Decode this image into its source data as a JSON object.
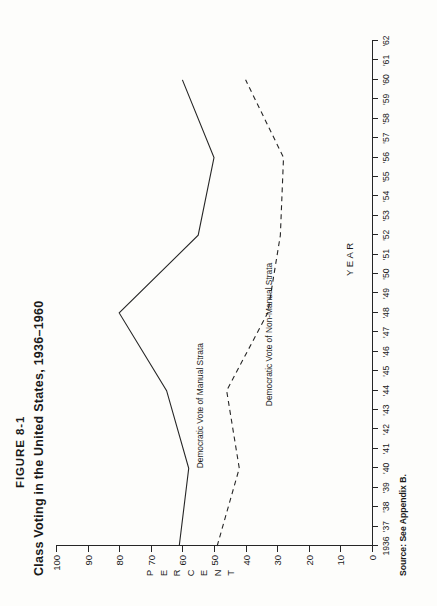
{
  "figure": {
    "number": "FIGURE 8-1",
    "title": "Class Voting in the United States, 1936–1960",
    "source": "Source: See Appendix B."
  },
  "chart_data": {
    "type": "line",
    "title": "Class Voting in the United States, 1936–1960",
    "xlabel": "YEAR",
    "ylabel": "PERCENT",
    "xlim": [
      1936,
      1962
    ],
    "ylim": [
      0,
      100
    ],
    "grid": false,
    "legend": "inline-labels",
    "x_ticks": [
      "1936",
      "'37",
      "'38",
      "'39",
      "'40",
      "'41",
      "'42",
      "'43",
      "'44",
      "'45",
      "'46",
      "'47",
      "'48",
      "'49",
      "'50",
      "'51",
      "'52",
      "'53",
      "'54",
      "'55",
      "'56",
      "'57",
      "'58",
      "'59",
      "'60",
      "'61",
      "'62"
    ],
    "y_ticks": [
      0,
      10,
      20,
      30,
      40,
      50,
      60,
      70,
      80,
      90,
      100
    ],
    "series": [
      {
        "name": "Democratic Vote of Manual Strata",
        "style": "solid",
        "x": [
          1936,
          1940,
          1944,
          1948,
          1952,
          1956,
          1960
        ],
        "values": [
          61,
          58,
          65,
          80,
          55,
          50,
          60
        ]
      },
      {
        "name": "Democratic Vote of Non-Manual Strata",
        "style": "dashed",
        "x": [
          1936,
          1940,
          1944,
          1948,
          1952,
          1956,
          1960
        ],
        "values": [
          49,
          42,
          46,
          33,
          29,
          28,
          40
        ]
      }
    ],
    "annotations": [
      {
        "text": "Democratic Vote of Manual Strata",
        "near_year": 1940
      },
      {
        "text": "Democratic Vote of Non-Manual Strata",
        "near_year": 1944
      }
    ]
  },
  "axis": {
    "y_title_letters": [
      "P",
      "E",
      "R",
      "C",
      "E",
      "N",
      "T"
    ],
    "x_title": "YEAR"
  }
}
